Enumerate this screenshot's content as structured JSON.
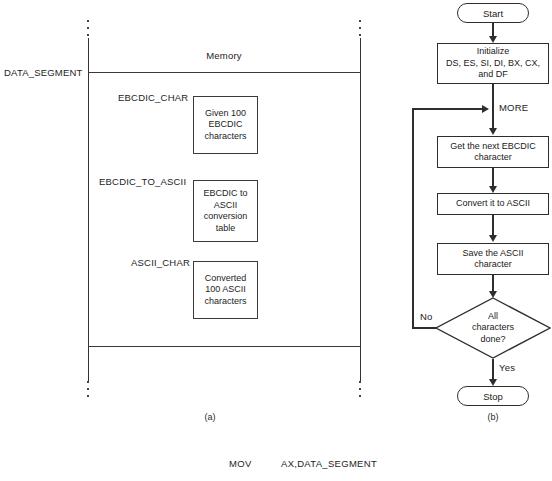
{
  "figure": {
    "panel_a": {
      "caption": "(a)",
      "memory_title": "Memory",
      "segment_label": "DATA_SEGMENT",
      "blocks": [
        {
          "label": "EBCDIC_CHAR",
          "content": "Given 100\nEBCDIC\ncharacters"
        },
        {
          "label": "EBCDIC_TO_ASCII",
          "content": "EBCDIC to\nASCII\nconversion\ntable"
        },
        {
          "label": "ASCII_CHAR",
          "content": "Converted\n100 ASCII\ncharacters"
        }
      ]
    },
    "panel_b": {
      "caption": "(b)",
      "start_label": "Start",
      "stop_label": "Stop",
      "loop_label": "MORE",
      "branch_no": "No",
      "branch_yes": "Yes",
      "steps": [
        {
          "text": "Initialize\nDS, ES, SI, DI, BX, CX,\nand DF"
        },
        {
          "text": "Get the next EBCDIC\ncharacter"
        },
        {
          "text": "Convert it to ASCII"
        },
        {
          "text": "Save the ASCII\ncharacter"
        }
      ],
      "decision": {
        "text": "All\ncharacters\ndone?"
      }
    },
    "code": {
      "mnemonic": "MOV",
      "operands": "AX,DATA_SEGMENT"
    }
  }
}
